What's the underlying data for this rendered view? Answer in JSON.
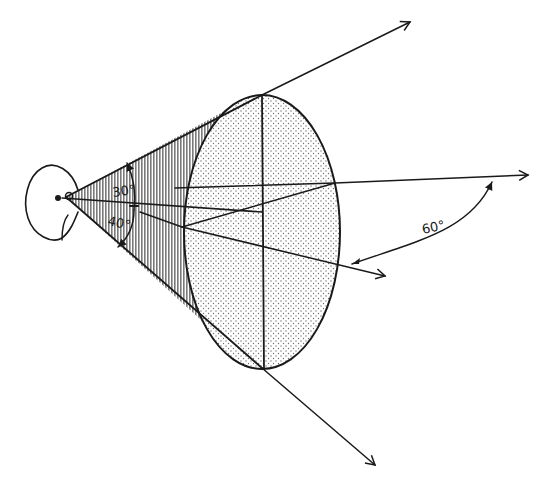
{
  "diagram": {
    "labels": {
      "upper_angle": "30°",
      "lower_angle": "40°",
      "side_angle": "60°"
    },
    "colors": {
      "ink": "#1a1a1a",
      "cone_shading": "#8a8a8a",
      "ellipse_stipple": "#6e6e6e",
      "background": "#ffffff"
    }
  }
}
